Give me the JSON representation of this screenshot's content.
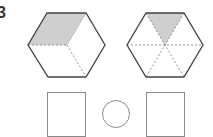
{
  "question": {
    "number": "3"
  },
  "figures": {
    "hexagon_left": {
      "description": "regular hexagon divided into 3 rhombi, top-left rhombus shaded",
      "shaded_fraction": "1/3"
    },
    "hexagon_right": {
      "description": "regular hexagon divided into 6 triangles, top triangle shaded",
      "shaded_fraction": "1/6"
    }
  },
  "answer_area": {
    "box_left": "",
    "comparison_circle": "",
    "box_right": ""
  },
  "colors": {
    "shade": "#cfcfcf",
    "outline": "#444444",
    "dashed": "#777777",
    "answer_box": "#8a8a8a"
  }
}
